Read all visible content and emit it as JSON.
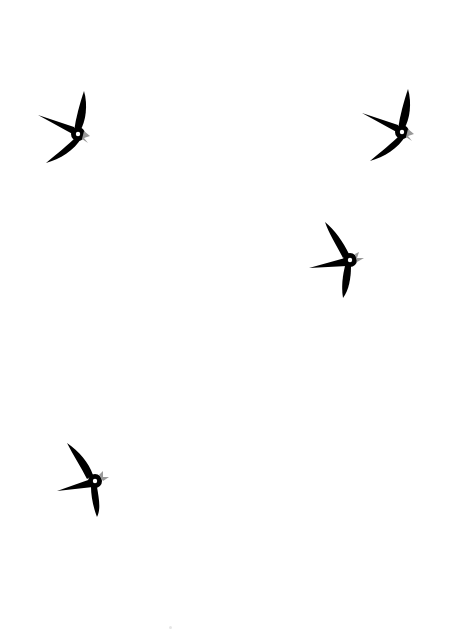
{
  "scene": {
    "background": "#ffffff",
    "bird_color": "#000000",
    "beak_color": "#999999",
    "eye_color": "#ffffff"
  },
  "birds": [
    {
      "id": "bird-1",
      "x": 38,
      "y": 91,
      "facing": "right",
      "pose": "wings-up"
    },
    {
      "id": "bird-2",
      "x": 362,
      "y": 89,
      "facing": "right",
      "pose": "wings-up"
    },
    {
      "id": "bird-3",
      "x": 309,
      "y": 222,
      "facing": "right",
      "pose": "wings-down"
    },
    {
      "id": "bird-4",
      "x": 57,
      "y": 443,
      "facing": "right",
      "pose": "wings-down"
    }
  ]
}
